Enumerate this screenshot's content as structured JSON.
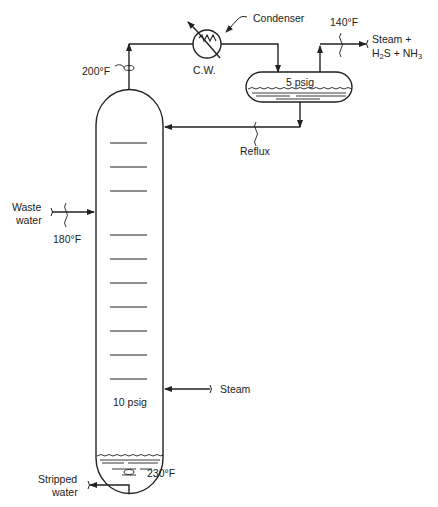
{
  "diagram": {
    "type": "process-flow",
    "colors": {
      "line": "#222222",
      "background": "#ffffff"
    },
    "equipment": {
      "column": {
        "label": "Stripping column",
        "pressure": "10 psig",
        "trays": 10
      },
      "condenser": {
        "label": "Condenser",
        "coolant": "C.W."
      },
      "reflux_drum": {
        "pressure": "5 psig"
      }
    },
    "streams": {
      "overhead_temp": "200°F",
      "feed_name_line1": "Waste",
      "feed_name_line2": "water",
      "feed_temp": "180°F",
      "vent_temp": "140°F",
      "vent_line1": "Steam +",
      "vent_line2_a": "H",
      "vent_line2_b": "2",
      "vent_line2_c": "S + NH",
      "vent_line2_d": "3",
      "reflux": "Reflux",
      "steam_in": "Steam",
      "bottoms_temp": "230°F",
      "bottoms_line1": "Stripped",
      "bottoms_line2": "water"
    }
  }
}
